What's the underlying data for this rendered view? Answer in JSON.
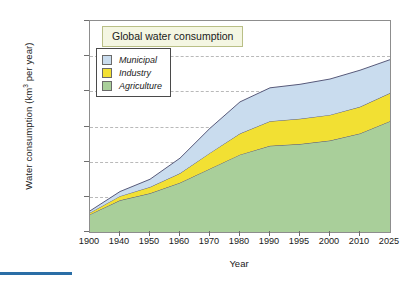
{
  "chart_data": {
    "type": "area",
    "stacked": true,
    "title": "Global water consumption",
    "xlabel": "Year",
    "ylabel": "Water consumption (km3 per year)",
    "ylabel_display": "Water consumption (km³ per year)",
    "categories": [
      "1900",
      "1940",
      "1950",
      "1960",
      "1970",
      "1980",
      "1990",
      "1995",
      "2000",
      "2010",
      "2025"
    ],
    "ylim": [
      0,
      6000
    ],
    "ytick_values": [
      0,
      1000,
      2000,
      3000,
      4000,
      5000,
      6000
    ],
    "ytick_labels": [
      "0",
      "1,000",
      "2,000",
      "3,000",
      "4,000",
      "5,000",
      "6,000"
    ],
    "grid": true,
    "grid_style": "dashed",
    "legend_position": "upper-left-inside",
    "series": [
      {
        "name": "Agriculture",
        "color": "#a9cf9a",
        "values": [
          500,
          900,
          1100,
          1400,
          1800,
          2200,
          2450,
          2500,
          2600,
          2800,
          3150
        ]
      },
      {
        "name": "Industry",
        "color": "#f2e033",
        "values": [
          50,
          120,
          180,
          270,
          450,
          600,
          700,
          720,
          730,
          760,
          800
        ]
      },
      {
        "name": "Municipal",
        "color": "#c9dcee",
        "values": [
          50,
          130,
          220,
          430,
          700,
          900,
          950,
          980,
          1020,
          1040,
          950
        ]
      }
    ],
    "totals": [
      600,
      1150,
      1500,
      2100,
      2950,
      3700,
      4100,
      4200,
      4350,
      4600,
      4900
    ]
  },
  "legend": {
    "items": [
      {
        "label": "Municipal",
        "color": "#c9dcee"
      },
      {
        "label": "Industry",
        "color": "#f2e033"
      },
      {
        "label": "Agriculture",
        "color": "#a9cf9a"
      }
    ]
  },
  "accent": {
    "rule_color": "#2a6ea6",
    "title_bg": "#f4f6e2",
    "title_border": "#b9bf86"
  }
}
